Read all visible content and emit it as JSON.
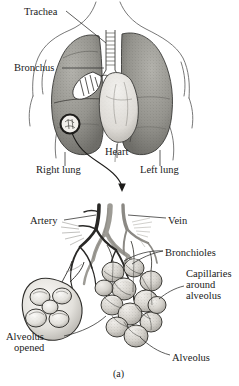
{
  "figure": {
    "caption": "(a)",
    "panels": [
      {
        "name": "thorax-lungs-heart",
        "labels": [
          {
            "id": "trachea",
            "text": "Trachea",
            "x": 24,
            "y": 6
          },
          {
            "id": "bronchus",
            "text": "Bronchus",
            "x": 14,
            "y": 62
          },
          {
            "id": "heart",
            "text": "Heart",
            "x": 105,
            "y": 146
          },
          {
            "id": "right_lung",
            "text": "Right lung",
            "x": 36,
            "y": 164
          },
          {
            "id": "left_lung",
            "text": "Left lung",
            "x": 140,
            "y": 164
          }
        ]
      },
      {
        "name": "alveolar-cluster",
        "labels": [
          {
            "id": "artery",
            "text": "Artery",
            "x": 30,
            "y": 215
          },
          {
            "id": "vein",
            "text": "Vein",
            "x": 168,
            "y": 215
          },
          {
            "id": "bronchioles",
            "text": "Bronchioles",
            "x": 165,
            "y": 247
          },
          {
            "id": "capillaries",
            "text": "Capillaries",
            "x": 186,
            "y": 268
          },
          {
            "id": "capillaries_around",
            "text": "around",
            "x": 186,
            "y": 279
          },
          {
            "id": "capillaries_alveolus",
            "text": "alveolus",
            "x": 186,
            "y": 290
          },
          {
            "id": "alveolus_opened_1",
            "text": "Alveolus",
            "x": 6,
            "y": 331
          },
          {
            "id": "alveolus_opened_2",
            "text": "opened",
            "x": 14,
            "y": 342
          },
          {
            "id": "alveolus",
            "text": "Alveolus",
            "x": 172,
            "y": 352
          }
        ]
      }
    ]
  },
  "colors": {
    "ink": "#1a1a1a",
    "outline": "#4a4a4a",
    "lung_fill": "#9a9a94",
    "lung_dark": "#6f6f6a",
    "heart_fill": "#e2e0dc",
    "vessel_dark": "#3a3a3a",
    "bronchiole_gray": "#a8a6a0",
    "alveoli_fill": "#d9d7d2",
    "background": "#ffffff"
  }
}
